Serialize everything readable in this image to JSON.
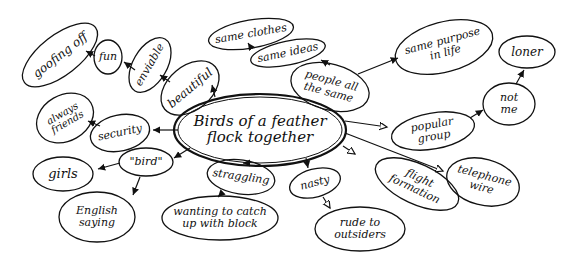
{
  "diagram": {
    "type": "mind-map",
    "ink_color": "#111111",
    "background": "#ffffff",
    "center": {
      "id": "center",
      "label": "Birds of a feather\nflock together"
    },
    "nodes": [
      {
        "id": "beautiful",
        "label": "beautiful"
      },
      {
        "id": "enviable",
        "label": "enviable"
      },
      {
        "id": "fun",
        "label": "fun"
      },
      {
        "id": "goofing_off",
        "label": "goofing off"
      },
      {
        "id": "security",
        "label": "security"
      },
      {
        "id": "always_friends",
        "label": "always\nfriends"
      },
      {
        "id": "bird",
        "label": "\"bird\""
      },
      {
        "id": "girls",
        "label": "girls"
      },
      {
        "id": "english_saying",
        "label": "English\nsaying"
      },
      {
        "id": "straggling",
        "label": "straggling"
      },
      {
        "id": "wanting_to_catch_up",
        "label": "wanting to catch\nup with block"
      },
      {
        "id": "nasty",
        "label": "nasty"
      },
      {
        "id": "rude_to_outsiders",
        "label": "rude to\noutsiders"
      },
      {
        "id": "flight_formation",
        "label": "flight\nformation"
      },
      {
        "id": "telephone_wire",
        "label": "telephone\nwire"
      },
      {
        "id": "popular_group",
        "label": "popular group"
      },
      {
        "id": "not_me",
        "label": "not\nme"
      },
      {
        "id": "loner",
        "label": "loner"
      },
      {
        "id": "people_all_the_same",
        "label": "people all\nthe same"
      },
      {
        "id": "same_ideas",
        "label": "same ideas"
      },
      {
        "id": "same_clothes",
        "label": "same clothes"
      },
      {
        "id": "same_purpose_in_life",
        "label": "same purpose\nin life"
      }
    ],
    "edges": [
      [
        "center",
        "beautiful"
      ],
      [
        "beautiful",
        "enviable"
      ],
      [
        "enviable",
        "fun"
      ],
      [
        "fun",
        "goofing_off"
      ],
      [
        "center",
        "security"
      ],
      [
        "security",
        "always_friends"
      ],
      [
        "center",
        "bird"
      ],
      [
        "bird",
        "girls"
      ],
      [
        "bird",
        "english_saying"
      ],
      [
        "center",
        "straggling"
      ],
      [
        "straggling",
        "wanting_to_catch_up"
      ],
      [
        "center",
        "nasty"
      ],
      [
        "nasty",
        "rude_to_outsiders"
      ],
      [
        "center",
        "flight_formation"
      ],
      [
        "center",
        "telephone_wire"
      ],
      [
        "center",
        "popular_group"
      ],
      [
        "popular_group",
        "not_me"
      ],
      [
        "not_me",
        "loner"
      ],
      [
        "center",
        "people_all_the_same"
      ],
      [
        "people_all_the_same",
        "same_ideas"
      ],
      [
        "same_ideas",
        "same_clothes"
      ],
      [
        "people_all_the_same",
        "same_purpose_in_life"
      ]
    ]
  }
}
